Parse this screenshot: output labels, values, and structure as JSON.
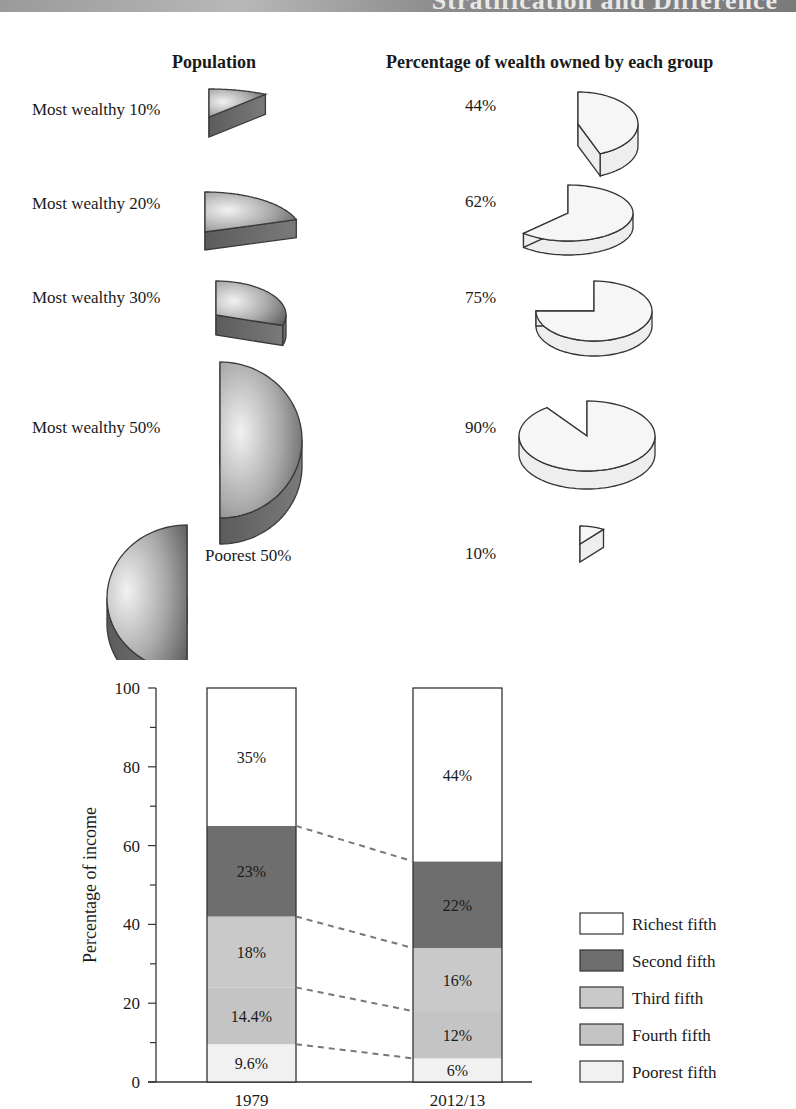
{
  "banner": {
    "title": "Stratification and Difference"
  },
  "pies": {
    "population_header": "Population",
    "wealth_header": "Percentage of wealth owned by each group",
    "rows": [
      {
        "label": "Most wealthy 10%",
        "population_pct": 10,
        "wealth_label": "44%",
        "wealth_pct": 44
      },
      {
        "label": "Most wealthy 20%",
        "population_pct": 20,
        "wealth_label": "62%",
        "wealth_pct": 62
      },
      {
        "label": "Most wealthy 30%",
        "population_pct": 30,
        "wealth_label": "75%",
        "wealth_pct": 75
      },
      {
        "label": "Most wealthy 50%",
        "population_pct": 50,
        "wealth_label": "90%",
        "wealth_pct": 90
      },
      {
        "label": "Poorest 50%",
        "population_pct": 50,
        "wealth_label": "10%",
        "wealth_pct": 10
      }
    ]
  },
  "chart_data": [
    {
      "type": "pie",
      "title": "Population vs. Percentage of wealth owned by each group",
      "categories": [
        "Most wealthy 10%",
        "Most wealthy 20%",
        "Most wealthy 30%",
        "Most wealthy 50%",
        "Poorest 50%"
      ],
      "series": [
        {
          "name": "Population",
          "values": [
            10,
            20,
            30,
            50,
            50
          ]
        },
        {
          "name": "Percentage of wealth owned by each group",
          "values": [
            44,
            62,
            75,
            90,
            10
          ]
        }
      ]
    },
    {
      "type": "bar",
      "stacked": true,
      "title": "",
      "xlabel": "",
      "ylabel": "Percentage of income",
      "ylim": [
        0,
        100
      ],
      "yticks": [
        0,
        20,
        40,
        60,
        80,
        100
      ],
      "categories": [
        "1979",
        "2012/13"
      ],
      "series": [
        {
          "name": "Poorest fifth",
          "values": [
            9.6,
            6
          ],
          "labels": [
            "9.6%",
            "6%"
          ],
          "color": "#f1f1f1"
        },
        {
          "name": "Fourth fifth",
          "values": [
            14.4,
            12
          ],
          "labels": [
            "14.4%",
            "12%"
          ],
          "color": "#c4c4c4"
        },
        {
          "name": "Third fifth",
          "values": [
            18,
            16
          ],
          "labels": [
            "18%",
            "16%"
          ],
          "color": "#c9c9c9"
        },
        {
          "name": "Second fifth",
          "values": [
            23,
            22
          ],
          "labels": [
            "23%",
            "22%"
          ],
          "color": "#6e6e6e"
        },
        {
          "name": "Richest fifth",
          "values": [
            35,
            44
          ],
          "labels": [
            "35%",
            "44%"
          ],
          "color": "#ffffff"
        }
      ],
      "legend": {
        "position": "right",
        "entries": [
          "Richest fifth",
          "Second fifth",
          "Third fifth",
          "Fourth fifth",
          "Poorest fifth"
        ]
      },
      "grid": false,
      "connector_lines": "dashed"
    }
  ]
}
